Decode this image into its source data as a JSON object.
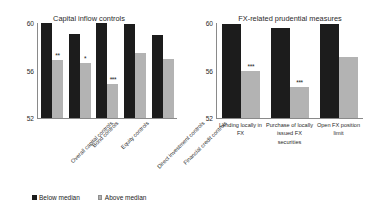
{
  "ghost_text": "",
  "charts": [
    {
      "title": "Capital inflow controls",
      "yticks": [
        "60",
        "56",
        "52"
      ],
      "legend": [
        {
          "label": "Below median",
          "swatch": "dark"
        },
        {
          "label": "Above median",
          "swatch": "light"
        }
      ],
      "categories": [
        "Overall capital controls",
        "Bond controls",
        "Equity controls",
        "Direct investment controls",
        "Financial credit controls"
      ],
      "bars": [
        {
          "dark": 60.0,
          "light": 56.9,
          "sig": "**"
        },
        {
          "dark": 59.1,
          "light": 56.7,
          "sig": "*"
        },
        {
          "dark": 60.0,
          "light": 54.9,
          "sig": "***"
        },
        {
          "dark": 59.9,
          "light": 57.5,
          "sig": ""
        },
        {
          "dark": 59.0,
          "light": 57.0,
          "sig": ""
        }
      ]
    },
    {
      "title": "FX-related prudential measures",
      "yticks": [
        "60",
        "56",
        "52"
      ],
      "legend": [
        {
          "label": "No restriction",
          "swatch": "dark"
        },
        {
          "label": "Restriction",
          "swatch": "light"
        }
      ],
      "categories": [
        "Lending locally in FX",
        "Purchase of locally issued FX securities",
        "Open FX position limit"
      ],
      "bars": [
        {
          "dark": 59.9,
          "light": 56.0,
          "sig": "***"
        },
        {
          "dark": 59.6,
          "light": 54.7,
          "sig": "***"
        },
        {
          "dark": 59.9,
          "light": 57.2,
          "sig": ""
        }
      ]
    }
  ],
  "chart_data": [
    {
      "type": "bar",
      "title": "Capital inflow controls",
      "xlabel": "",
      "ylabel": "",
      "ylim": [
        52,
        60
      ],
      "yticks": [
        52,
        56,
        60
      ],
      "grid": false,
      "legend_position": "bottom",
      "categories": [
        "Overall capital controls",
        "Bond controls",
        "Equity controls",
        "Direct investment controls",
        "Financial credit controls"
      ],
      "series": [
        {
          "name": "Below median",
          "values": [
            60.0,
            59.1,
            60.0,
            59.9,
            59.0
          ]
        },
        {
          "name": "Above median",
          "values": [
            56.9,
            56.7,
            54.9,
            57.5,
            57.0
          ]
        }
      ],
      "annotations": [
        "**",
        "*",
        "***",
        "",
        ""
      ]
    },
    {
      "type": "bar",
      "title": "FX-related prudential measures",
      "xlabel": "",
      "ylabel": "",
      "ylim": [
        52,
        60
      ],
      "yticks": [
        52,
        56,
        60
      ],
      "grid": false,
      "legend_position": "bottom",
      "categories": [
        "Lending locally in FX",
        "Purchase of locally issued FX securities",
        "Open FX position limit"
      ],
      "series": [
        {
          "name": "No restriction",
          "values": [
            59.9,
            59.6,
            59.9
          ]
        },
        {
          "name": "Restriction",
          "values": [
            56.0,
            54.7,
            57.2
          ]
        }
      ],
      "annotations": [
        "***",
        "***",
        ""
      ]
    }
  ]
}
